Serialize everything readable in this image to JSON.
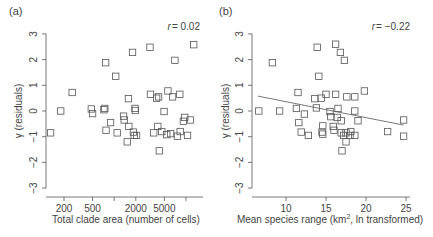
{
  "figure": {
    "panels": [
      {
        "label": "(a)",
        "annotation": "r = 0.02",
        "annotation_r": "r",
        "annotation_val": "= 0.02",
        "xlabel": "Total clade area (number of cells)",
        "ylabel": "γ (residuals)",
        "xticks": [
          "200",
          "500",
          "",
          "2000",
          "5000",
          ""
        ],
        "yticks": [
          "−3",
          "−2",
          "−1",
          "0",
          "1",
          "2",
          "3"
        ]
      },
      {
        "label": "(b)",
        "annotation": "r = −0.22",
        "annotation_r": "r",
        "annotation_val": "= −0.22",
        "xlabel_main": "Mean species range (km",
        "xlabel_sup": "2",
        "xlabel_tail": ", ln transformed)",
        "ylabel": "γ (residuals)",
        "xticks": [
          "10",
          "15",
          "20",
          "25"
        ],
        "yticks": [
          "−3",
          "−2",
          "−1",
          "0",
          "1",
          "2",
          "3"
        ]
      }
    ]
  },
  "chart_data": [
    {
      "type": "scatter",
      "title": "(a)",
      "annotation": "r = 0.02",
      "xlabel": "Total clade area (number of cells)",
      "ylabel": "γ (residuals)",
      "xscale": "log",
      "xlim": [
        100,
        16000
      ],
      "ylim": [
        -3.3,
        3.3
      ],
      "xticks": [
        200,
        500,
        1000,
        2000,
        5000,
        10000
      ],
      "yticks": [
        -3,
        -2,
        -1,
        0,
        1,
        2,
        3
      ],
      "grid": false,
      "marker": "open-square",
      "points": [
        [
          130,
          -0.85
        ],
        [
          180,
          0.0
        ],
        [
          260,
          0.72
        ],
        [
          480,
          0.08
        ],
        [
          500,
          -0.1
        ],
        [
          720,
          0.05
        ],
        [
          740,
          0.1
        ],
        [
          760,
          1.88
        ],
        [
          770,
          -0.75
        ],
        [
          890,
          -0.45
        ],
        [
          1050,
          1.35
        ],
        [
          1100,
          -0.85
        ],
        [
          1350,
          -0.2
        ],
        [
          1380,
          -0.35
        ],
        [
          1520,
          -1.2
        ],
        [
          1580,
          0.48
        ],
        [
          1600,
          -0.6
        ],
        [
          1800,
          2.28
        ],
        [
          1850,
          -0.82
        ],
        [
          1900,
          -0.95
        ],
        [
          1950,
          0.1
        ],
        [
          1970,
          0.02
        ],
        [
          2050,
          -0.95
        ],
        [
          3150,
          2.48
        ],
        [
          3200,
          0.65
        ],
        [
          3550,
          -0.85
        ],
        [
          3900,
          0.5
        ],
        [
          4050,
          -0.6
        ],
        [
          4150,
          0.55
        ],
        [
          4250,
          -1.55
        ],
        [
          4600,
          -0.8
        ],
        [
          4950,
          -0.02
        ],
        [
          5400,
          -0.92
        ],
        [
          5600,
          0.78
        ],
        [
          6100,
          -0.88
        ],
        [
          6500,
          0.55
        ],
        [
          7000,
          1.97
        ],
        [
          7600,
          -0.98
        ],
        [
          8200,
          0.65
        ],
        [
          8300,
          -0.8
        ],
        [
          9200,
          -0.4
        ],
        [
          9600,
          -0.25
        ],
        [
          10500,
          -0.95
        ],
        [
          11500,
          -0.35
        ],
        [
          12800,
          2.58
        ]
      ]
    },
    {
      "type": "scatter",
      "title": "(b)",
      "annotation": "r = −0.22",
      "xlabel": "Mean species range (km², ln transformed)",
      "ylabel": "γ (residuals)",
      "xlim": [
        6,
        26
      ],
      "ylim": [
        -3.3,
        3.3
      ],
      "xticks": [
        10,
        15,
        20,
        25
      ],
      "yticks": [
        -3,
        -2,
        -1,
        0,
        1,
        2,
        3
      ],
      "grid": false,
      "marker": "open-square",
      "regression_line": {
        "x": [
          6.5,
          24.7
        ],
        "y": [
          0.58,
          -0.55
        ]
      },
      "points": [
        [
          6.6,
          0.0
        ],
        [
          8.3,
          1.88
        ],
        [
          9.2,
          0.0
        ],
        [
          11.3,
          0.1
        ],
        [
          11.5,
          0.72
        ],
        [
          11.6,
          -0.45
        ],
        [
          11.9,
          -0.82
        ],
        [
          12.3,
          -0.12
        ],
        [
          12.8,
          -0.95
        ],
        [
          13.6,
          0.48
        ],
        [
          13.8,
          0.12
        ],
        [
          13.9,
          2.48
        ],
        [
          14.1,
          1.35
        ],
        [
          14.4,
          0.5
        ],
        [
          14.5,
          -0.82
        ],
        [
          14.6,
          -0.58
        ],
        [
          14.6,
          -0.9
        ],
        [
          15.0,
          0.65
        ],
        [
          15.5,
          -0.02
        ],
        [
          15.6,
          -0.22
        ],
        [
          15.9,
          -0.6
        ],
        [
          16.0,
          -0.75
        ],
        [
          16.2,
          2.6
        ],
        [
          16.2,
          0.65
        ],
        [
          16.4,
          -0.25
        ],
        [
          16.5,
          0.1
        ],
        [
          16.8,
          2.28
        ],
        [
          16.9,
          -0.38
        ],
        [
          16.9,
          -0.85
        ],
        [
          17.0,
          -1.55
        ],
        [
          17.2,
          -0.95
        ],
        [
          17.3,
          1.97
        ],
        [
          17.5,
          -1.2
        ],
        [
          17.5,
          -0.85
        ],
        [
          17.6,
          0.55
        ],
        [
          18.0,
          -0.95
        ],
        [
          18.1,
          -0.8
        ],
        [
          18.6,
          0.0
        ],
        [
          18.6,
          0.55
        ],
        [
          18.6,
          -0.95
        ],
        [
          19.0,
          -0.38
        ],
        [
          19.8,
          0.78
        ],
        [
          22.7,
          -0.8
        ],
        [
          24.7,
          -0.35
        ],
        [
          24.7,
          -0.98
        ]
      ]
    }
  ]
}
